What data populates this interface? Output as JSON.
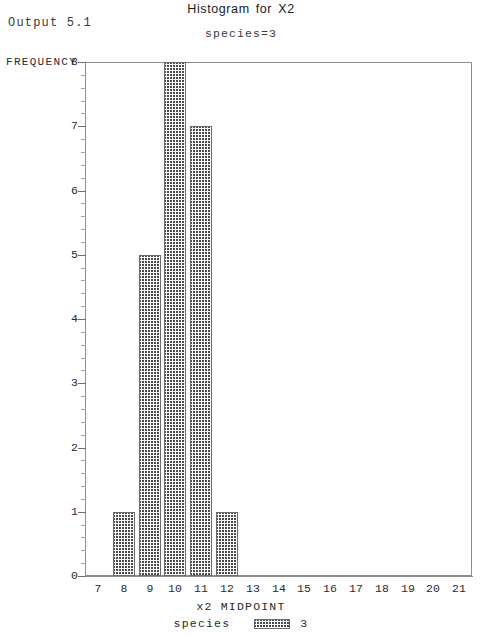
{
  "page": {
    "output_label": "Output 5.1"
  },
  "chart_data": {
    "type": "bar",
    "title": "Histogram for X2",
    "subtitle": "species=3",
    "xlabel": "x2 MIDPOINT",
    "ylabel": "FREQUENCY",
    "categories": [
      7,
      8,
      9,
      10,
      11,
      12,
      13,
      14,
      15,
      16,
      17,
      18,
      19,
      20,
      21
    ],
    "values": [
      0,
      1,
      5,
      8,
      7,
      1,
      0,
      0,
      0,
      0,
      0,
      0,
      0,
      0,
      0
    ],
    "xtick_labels": [
      "7",
      "8",
      "9",
      "10",
      "11",
      "12",
      "13",
      "14",
      "15",
      "16",
      "17",
      "18",
      "19",
      "20",
      "21"
    ],
    "ytick_labels": [
      "0",
      "1",
      "2",
      "3",
      "4",
      "5",
      "6",
      "7",
      "8"
    ],
    "ylim": [
      0,
      8
    ],
    "xlim": [
      6.5,
      21.5
    ],
    "y_minor_ticks_per_major": 5,
    "grid": false,
    "legend": {
      "position": "bottom",
      "name": "species",
      "value": "3",
      "swatch": "crosshatch-pattern"
    },
    "bar_fill": "#4a4a4a",
    "frame_color": "#8d8d8d"
  }
}
